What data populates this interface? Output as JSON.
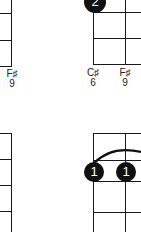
{
  "diagrams": [
    {
      "id": "top-left",
      "labels": [
        {
          "note": "F♯",
          "fret": "9"
        }
      ]
    },
    {
      "id": "top-right",
      "dots": [
        {
          "finger": "2"
        }
      ],
      "labels": [
        {
          "note": "C♯",
          "fret": "6"
        },
        {
          "note": "F♯",
          "fret": "9"
        }
      ]
    },
    {
      "id": "bottom-left"
    },
    {
      "id": "bottom-right",
      "dots": [
        {
          "finger": "1"
        },
        {
          "finger": "1"
        }
      ],
      "barre": true
    }
  ]
}
